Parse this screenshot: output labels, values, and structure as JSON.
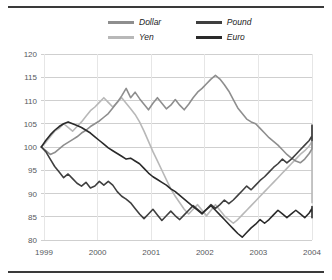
{
  "chart_data": {
    "type": "line",
    "title": "",
    "subtitle": "",
    "xlabel": "",
    "ylabel": "",
    "xlim": [
      1999,
      2004
    ],
    "ylim": [
      80,
      120
    ],
    "ytick_values": [
      80,
      85,
      90,
      95,
      100,
      105,
      110,
      115,
      120
    ],
    "ytick_labels": [
      "80",
      "85",
      "90",
      "95",
      "100",
      "105",
      "110",
      "115",
      "120"
    ],
    "xtick_values": [
      1999,
      2000,
      2001,
      2002,
      2003,
      2004
    ],
    "xtick_labels": [
      "1999",
      "2000",
      "2001",
      "2002",
      "2003",
      "2004"
    ],
    "grid": "horizontal-and-vertical",
    "legend_position": "top-center",
    "legend_entries": [
      "Dollar",
      "Pound",
      "Yen",
      "Euro"
    ],
    "x_start": 1998.95,
    "x_step": 0.0833,
    "series": [
      {
        "name": "Dollar",
        "color": "#8e8e8e",
        "width": 1.6,
        "values": [
          100.0,
          99.2,
          98.4,
          98.8,
          99.6,
          100.4,
          101.0,
          101.6,
          102.2,
          103.0,
          103.6,
          104.4,
          105.0,
          105.6,
          106.4,
          107.2,
          108.4,
          109.6,
          111.0,
          112.6,
          110.6,
          111.8,
          110.4,
          109.2,
          108.0,
          109.4,
          110.6,
          109.4,
          108.2,
          109.0,
          110.2,
          109.0,
          108.0,
          109.2,
          110.6,
          111.8,
          112.6,
          113.6,
          114.6,
          115.4,
          114.6,
          113.4,
          112.0,
          110.2,
          108.4,
          107.2,
          106.0,
          105.4,
          105.0,
          104.0,
          103.0,
          102.0,
          101.2,
          100.4,
          99.4,
          98.4,
          97.6,
          97.0,
          96.6,
          97.4,
          98.6,
          99.6,
          100.6,
          101.6,
          102.6,
          103.4,
          103.0,
          102.4,
          103.2,
          104.2,
          104.6,
          104.4,
          104.8
        ]
      },
      {
        "name": "Pound",
        "color": "#3f3f3f",
        "width": 1.6,
        "values": [
          100.0,
          99.0,
          97.4,
          95.8,
          94.6,
          93.4,
          94.2,
          93.2,
          92.2,
          91.6,
          92.4,
          91.2,
          91.6,
          92.6,
          91.8,
          92.6,
          91.8,
          90.4,
          89.4,
          88.8,
          88.0,
          86.8,
          85.6,
          84.6,
          85.6,
          86.6,
          85.4,
          84.2,
          85.2,
          86.2,
          85.2,
          84.4,
          85.4,
          86.4,
          87.4,
          86.6,
          85.8,
          86.6,
          87.6,
          86.8,
          87.6,
          88.6,
          87.8,
          88.6,
          89.6,
          90.6,
          91.6,
          90.8,
          91.8,
          92.8,
          93.6,
          94.6,
          95.6,
          96.4,
          97.4,
          96.6,
          97.4,
          98.4,
          99.4,
          100.4,
          101.4,
          102.4,
          103.4,
          104.2,
          104.6,
          104.2,
          103.4,
          104.2,
          103.4,
          102.2,
          101.4,
          102.4,
          103.0
        ]
      },
      {
        "name": "Yen",
        "color": "#b8b8b8",
        "width": 1.6,
        "values": [
          100.0,
          101.0,
          102.2,
          103.4,
          104.0,
          105.0,
          104.2,
          103.4,
          104.4,
          105.4,
          106.6,
          107.8,
          108.6,
          109.6,
          110.6,
          109.6,
          108.6,
          109.6,
          110.6,
          109.4,
          108.2,
          107.0,
          105.4,
          103.4,
          101.2,
          99.0,
          97.0,
          95.0,
          93.0,
          91.0,
          89.4,
          88.0,
          86.6,
          85.6,
          86.6,
          87.6,
          86.4,
          85.2,
          86.4,
          87.6,
          86.4,
          85.2,
          84.4,
          83.6,
          84.4,
          85.4,
          86.4,
          87.4,
          88.4,
          89.4,
          90.4,
          91.4,
          92.4,
          93.4,
          94.4,
          95.4,
          96.4,
          97.4,
          98.4,
          99.2,
          100.2,
          101.2,
          100.4,
          99.4,
          97.4,
          95.4,
          93.6,
          92.6,
          91.6,
          90.6,
          89.6,
          88.6,
          88.0
        ]
      },
      {
        "name": "Euro",
        "color": "#2a2a2a",
        "width": 1.6,
        "values": [
          100.0,
          101.4,
          102.6,
          103.6,
          104.4,
          105.0,
          105.4,
          105.0,
          104.6,
          104.2,
          103.6,
          103.0,
          102.2,
          101.4,
          100.6,
          99.8,
          99.2,
          98.6,
          98.0,
          97.4,
          97.6,
          97.0,
          96.4,
          95.4,
          94.4,
          93.6,
          93.0,
          92.4,
          91.8,
          91.0,
          90.4,
          89.6,
          88.8,
          88.0,
          87.2,
          86.4,
          85.6,
          86.6,
          87.4,
          86.4,
          85.4,
          84.4,
          83.4,
          82.4,
          81.4,
          80.6,
          81.6,
          82.6,
          83.4,
          84.4,
          83.6,
          84.4,
          85.4,
          86.4,
          85.6,
          84.8,
          85.6,
          86.4,
          85.6,
          84.8,
          85.8,
          86.8,
          86.0,
          85.2,
          86.2,
          87.2,
          86.4,
          85.6,
          86.4,
          85.6,
          84.8,
          85.6,
          86.2
        ]
      }
    ]
  },
  "legend": {
    "items": [
      {
        "label": "Dollar",
        "series": 0
      },
      {
        "label": "Pound",
        "series": 1
      },
      {
        "label": "Yen",
        "series": 2
      },
      {
        "label": "Euro",
        "series": 3
      }
    ]
  },
  "colors": {
    "dollar": "#8e8e8e",
    "pound": "#3f3f3f",
    "yen": "#b8b8b8",
    "euro": "#2a2a2a",
    "grid": "#cfcfcf",
    "axis_text": "#55585c",
    "rule": "#3a3a3a",
    "background": "#ffffff"
  }
}
